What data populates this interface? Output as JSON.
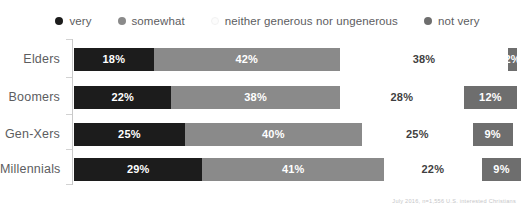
{
  "chart_data": {
    "type": "bar",
    "subtype": "stacked-horizontal-100",
    "title": "",
    "xlabel": "",
    "ylabel": "",
    "xlim": [
      0,
      100
    ],
    "grid": false,
    "legend_position": "top",
    "categories": [
      "Elders",
      "Boomers",
      "Gen-Xers",
      "Millennials"
    ],
    "series": [
      {
        "name": "very",
        "color": "#1c1c1c",
        "label_color": "#ffffff",
        "values": [
          18,
          22,
          25,
          29
        ]
      },
      {
        "name": "somewhat",
        "color": "#8a8a8a",
        "label_color": "#ffffff",
        "values": [
          42,
          38,
          40,
          41
        ]
      },
      {
        "name": "neither generous nor ungenerous",
        "color": "#ffffff",
        "label_color": "#3f3f41",
        "values": [
          38,
          28,
          25,
          22
        ]
      },
      {
        "name": "not very",
        "color": "#6e6e6e",
        "label_color": "#ffffff",
        "values": [
          2,
          12,
          9,
          9
        ]
      }
    ],
    "value_labels": [
      [
        "18%",
        "42%",
        "38%",
        "2%"
      ],
      [
        "22%",
        "38%",
        "28%",
        "12%"
      ],
      [
        "25%",
        "40%",
        "25%",
        "9%"
      ],
      [
        "29%",
        "41%",
        "22%",
        "9%"
      ]
    ],
    "annotations": [
      "July 2016, n=1,556 U.S. interested Christians"
    ]
  },
  "legend": {
    "items": [
      {
        "label": "very",
        "color": "#1c1c1c",
        "light": false
      },
      {
        "label": "somewhat",
        "color": "#8a8a8a",
        "light": false
      },
      {
        "label": "neither generous nor ungenerous",
        "color": "#fcfcfc",
        "light": true
      },
      {
        "label": "not very",
        "color": "#6e6e6e",
        "light": false
      }
    ]
  },
  "footnote": {
    "text": "July 2016, n=1,556 U.S. interested Christians"
  }
}
